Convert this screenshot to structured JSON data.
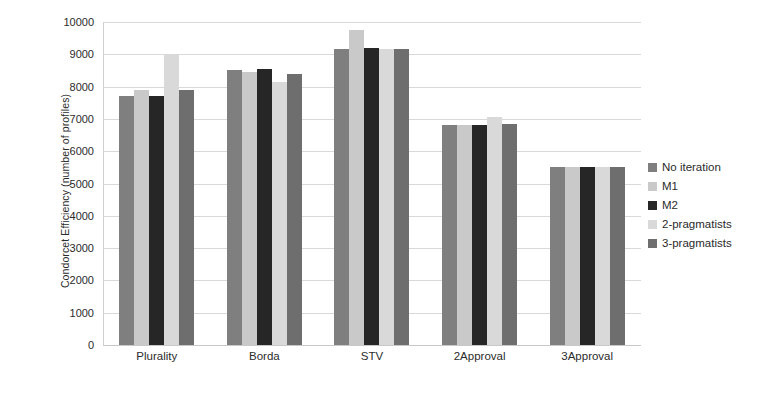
{
  "chart_data": {
    "type": "bar",
    "title": "",
    "xlabel": "",
    "ylabel": "Condorcet Efficiency (number of profiles)",
    "ylim": [
      0,
      10000
    ],
    "ytick_step": 1000,
    "yticks": [
      "0",
      "1000",
      "2000",
      "3000",
      "4000",
      "5000",
      "6000",
      "7000",
      "8000",
      "9000",
      "10000"
    ],
    "grid": true,
    "legend_position": "right",
    "categories": [
      "Plurality",
      "Borda",
      "STV",
      "2Approval",
      "3Approval"
    ],
    "series": [
      {
        "name": "No iteration",
        "color": "#7f7f7f",
        "values": [
          7700,
          8500,
          9150,
          6820,
          5520
        ]
      },
      {
        "name": "M1",
        "color": "#c9c9c9",
        "values": [
          7900,
          8450,
          9750,
          6820,
          5520
        ]
      },
      {
        "name": "M2",
        "color": "#262626",
        "values": [
          7700,
          8550,
          9200,
          6820,
          5520
        ]
      },
      {
        "name": "2-pragmatists",
        "color": "#d9d9d9",
        "values": [
          9000,
          8150,
          9150,
          7050,
          5520
        ]
      },
      {
        "name": "3-pragmatists",
        "color": "#6e6e6e",
        "values": [
          7900,
          8400,
          9150,
          6850,
          5520
        ]
      }
    ]
  },
  "legend": {
    "items": [
      {
        "label": "No iteration",
        "color": "#7f7f7f"
      },
      {
        "label": "M1",
        "color": "#c9c9c9"
      },
      {
        "label": "M2",
        "color": "#262626"
      },
      {
        "label": "2-pragmatists",
        "color": "#d9d9d9"
      },
      {
        "label": "3-pragmatists",
        "color": "#6e6e6e"
      }
    ]
  },
  "colors": {
    "background": "#ffffff",
    "text": "#2b2b2b",
    "gridline": "#d9d9d9",
    "axis": "#cfcfcf"
  }
}
